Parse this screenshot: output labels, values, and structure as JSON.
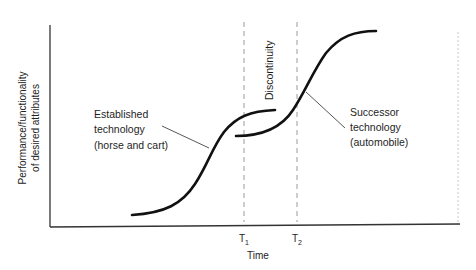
{
  "diagram": {
    "y_axis_label_line1": "Performance/functionality",
    "y_axis_label_line2": "of desired attributes",
    "x_axis_label": "Time",
    "markers": [
      {
        "label": "T",
        "sub": "1"
      },
      {
        "label": "T",
        "sub": "2"
      }
    ],
    "discontinuity_label": "Discontinuity",
    "curves": [
      {
        "name": "established",
        "label_lines": [
          "Established",
          "technology",
          "(horse and cart)"
        ]
      },
      {
        "name": "successor",
        "label_lines": [
          "Successor",
          "technology",
          "(automobile)"
        ]
      }
    ],
    "colors": {
      "curve": "#111111",
      "axis": "#333333",
      "dashed": "#9a9a9a",
      "leader": "#444444"
    }
  }
}
